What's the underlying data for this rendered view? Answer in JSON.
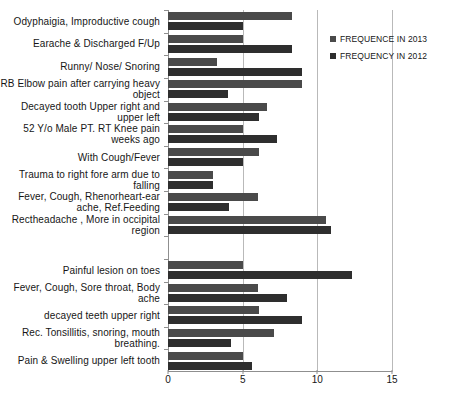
{
  "chart_data": {
    "type": "bar",
    "orientation": "horizontal",
    "title": "",
    "xlabel": "",
    "ylabel": "",
    "xlim": [
      0,
      15
    ],
    "xticks": [
      0,
      5,
      10,
      15
    ],
    "grid": true,
    "legend_position": "right",
    "categories": [
      "Odyphaigia, Improductive cough",
      "Earache & Discharged F/Up",
      "Runny/ Nose/ Snoring",
      "RB Elbow pain after carrying heavy object",
      "Decayed tooth Upper right and upper left",
      "52 Y/o Male PT. RT Knee pain weeks ago",
      "With Cough/Fever",
      "Trauma to right fore arm due to falling",
      "Fever, Cough, Rhenorheart-ear ache, Ref.Feeding",
      "Rectheadache , More in occipital region",
      "",
      "Painful lesion on toes",
      "Fever, Cough, Sore throat, Body ache",
      "decayed teeth upper right",
      "Rec. Tonsillitis, snoring, mouth breathing.",
      "Pain & Swelling upper left tooth"
    ],
    "series": [
      {
        "name": "FREQUENCE IN 2013",
        "color": "#4a4a4a",
        "values": [
          8.3,
          5.0,
          3.3,
          9.0,
          6.6,
          5.0,
          6.1,
          3.0,
          6.0,
          10.6,
          0,
          5.0,
          6.0,
          6.1,
          7.1,
          5.0
        ]
      },
      {
        "name": "FREQUENCY IN 2012",
        "color": "#2e2e2e",
        "values": [
          5.0,
          8.3,
          9.0,
          4.0,
          6.1,
          7.3,
          5.0,
          3.0,
          4.1,
          10.9,
          0,
          12.3,
          8.0,
          9.0,
          4.2,
          5.6
        ]
      }
    ]
  },
  "legend": {
    "items": [
      {
        "label": "FREQUENCE IN 2013",
        "color": "#4a4a4a"
      },
      {
        "label": "FREQUENCY IN 2012",
        "color": "#2e2e2e"
      }
    ]
  }
}
